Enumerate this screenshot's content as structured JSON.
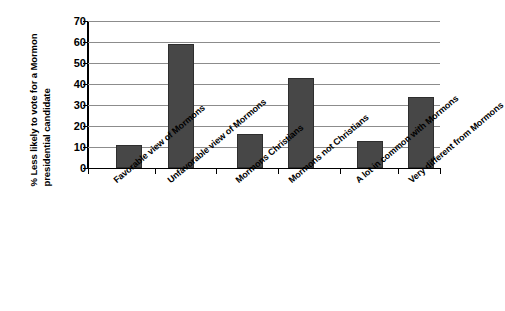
{
  "chart_data": {
    "type": "bar",
    "title": "",
    "xlabel": "",
    "ylabel": "% Less likely to vote for a Mormon presidential candidate",
    "ylabel_lines": [
      "% Less likely to vote for a Mormon",
      "presidential candidate"
    ],
    "categories": [
      "Favorable view of Mormons",
      "Unfavorable view of Mormons",
      "Mormons Christians",
      "Mormons not Christians",
      "A lot in common with Mormons",
      "Very different from Mormons"
    ],
    "values": [
      11,
      59,
      16,
      43,
      13,
      34
    ],
    "ylim": [
      0,
      70
    ],
    "yticks": [
      0,
      10,
      20,
      30,
      40,
      50,
      60,
      70
    ],
    "ytick_labels": [
      "0",
      "10",
      "20",
      "30",
      "40",
      "50",
      "60",
      "70"
    ],
    "grid": true,
    "legend": false,
    "bar_color": "#474747",
    "grid_color": "#8c8c8c",
    "axis_color": "#000000"
  }
}
